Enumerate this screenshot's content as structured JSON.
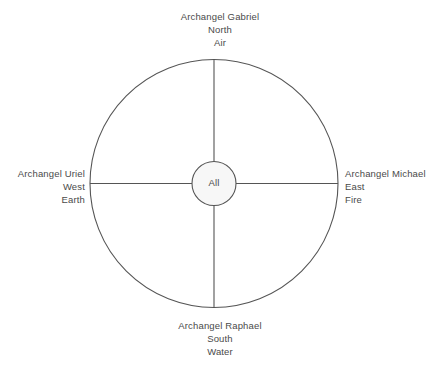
{
  "diagram": {
    "type": "medicine-wheel",
    "center": {
      "label": "All"
    },
    "colors": {
      "stroke": "#555555",
      "text": "#4a4a4a",
      "center_fill": "#f7f7f7",
      "background": "#ffffff"
    },
    "quadrants": [
      {
        "position": "north",
        "archangel": "Archangel Gabriel",
        "direction": "North",
        "element": "Air"
      },
      {
        "position": "east",
        "archangel": "Archangel Michael",
        "direction": "East",
        "element": "Fire"
      },
      {
        "position": "south",
        "archangel": "Archangel Raphael",
        "direction": "South",
        "element": "Water"
      },
      {
        "position": "west",
        "archangel": "Archangel Uriel",
        "direction": "West",
        "element": "Earth"
      }
    ]
  }
}
